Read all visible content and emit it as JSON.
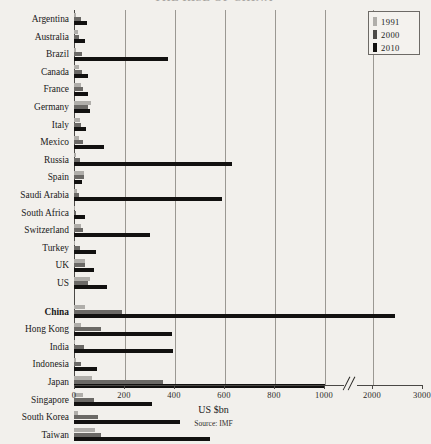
{
  "title": "THE RISE OF CHINA",
  "legend": {
    "position": "top-right",
    "items": [
      {
        "label": "1991",
        "color": "#b0aeaa"
      },
      {
        "label": "2000",
        "color": "#4c4a47"
      },
      {
        "label": "2010",
        "color": "#121110"
      }
    ]
  },
  "axis": {
    "caption": "US $bn",
    "source": "Source: IMF",
    "ticks": [
      {
        "label": "0",
        "value": 0,
        "x": 74
      },
      {
        "label": "200",
        "value": 200,
        "x": 124
      },
      {
        "label": "400",
        "value": 400,
        "x": 174
      },
      {
        "label": "600",
        "value": 600,
        "x": 224
      },
      {
        "label": "800",
        "value": 800,
        "x": 274
      },
      {
        "label": "1000",
        "value": 1000,
        "x": 324
      },
      {
        "label": "2000",
        "value": 2000,
        "x": 372
      },
      {
        "label": "3000",
        "value": 3000,
        "x": 422
      }
    ],
    "break_x": 350,
    "gridlines_x": [
      124,
      174,
      224,
      274,
      324,
      372
    ]
  },
  "chart_data": {
    "type": "bar",
    "orientation": "horizontal",
    "title": "THE RISE OF CHINA",
    "xlabel": "US $bn",
    "ylabel": "",
    "xlim": [
      0,
      3000
    ],
    "grid": true,
    "legend": [
      "1991",
      "2000",
      "2010"
    ],
    "axis_break": {
      "after": 1000,
      "before": 2000
    },
    "groups": [
      {
        "name": "rest-of-world",
        "categories": [
          "Argentina",
          "Australia",
          "Brazil",
          "Canada",
          "France",
          "Germany",
          "Italy",
          "Mexico",
          "Russia",
          "Spain",
          "Saudi Arabia",
          "South Africa",
          "Switzerland",
          "Turkey",
          "UK",
          "US"
        ],
        "series": [
          {
            "name": "1991",
            "values": [
              8,
              17,
              9,
              20,
              28,
              66,
              25,
              18,
              6,
              40,
              12,
              3,
              28,
              5,
              44,
              64
            ]
          },
          {
            "name": "2000",
            "values": [
              26,
              21,
              33,
              32,
              37,
              57,
              26,
              35,
              25,
              38,
              20,
              7,
              34,
              23,
              44,
              56
            ]
          },
          {
            "name": "2010",
            "values": [
              52,
              43,
              375,
              57,
              56,
              62,
              49,
              120,
              630,
              30,
              590,
              44,
              305,
              86,
              80,
              132
            ]
          }
        ]
      },
      {
        "name": "asia",
        "categories": [
          "China",
          "Hong Kong",
          "India",
          "Indonesia",
          "Japan",
          "Singapore",
          "South Korea",
          "Taiwan"
        ],
        "series": [
          {
            "name": "1991",
            "values": [
              43,
              29,
              4,
              9,
              72,
              34,
              14,
              82
            ]
          },
          {
            "name": "2000",
            "values": [
              190,
              108,
              38,
              29,
              355,
              80,
              96,
              107
            ]
          },
          {
            "name": "2010",
            "values": [
              2450,
              390,
              395,
              90,
              1060,
              310,
              425,
              545
            ]
          }
        ]
      }
    ]
  }
}
